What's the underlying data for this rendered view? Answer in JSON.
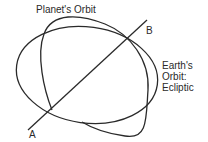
{
  "diagram": {
    "labels": {
      "planet_orbit": "Planet's Orbit",
      "point_b": "B",
      "point_a": "A",
      "earth_orbit_line1": "Earth's",
      "earth_orbit_line2": "Orbit:",
      "earth_orbit_line3": "Ecliptic"
    },
    "elements": {
      "earth_orbit": "ellipse",
      "planet_orbit": "inclined ellipse",
      "line_of_nodes": "line A-B"
    },
    "colors": {
      "stroke": "#2a2a2a",
      "background": "#ffffff"
    }
  }
}
